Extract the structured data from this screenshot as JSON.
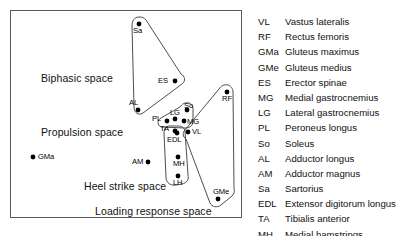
{
  "figure": {
    "title": "",
    "frame": {
      "x": 10,
      "y": 10,
      "w": 232,
      "h": 208
    }
  },
  "chart_data": {
    "type": "scatter",
    "title": "",
    "xlabel": "",
    "ylabel": "",
    "grid": false,
    "legend_position": "right",
    "axis_visible": false,
    "points": [
      {
        "abbr": "Sa",
        "x": 139,
        "y": 24,
        "label_dx": -6,
        "label_dy": 10
      },
      {
        "abbr": "ES",
        "x": 175,
        "y": 81,
        "label_dx": -17,
        "label_dy": 3
      },
      {
        "abbr": "AL",
        "x": 138,
        "y": 110,
        "label_dx": -9,
        "label_dy": -4
      },
      {
        "abbr": "RF",
        "x": 227,
        "y": 92,
        "label_dx": -5,
        "label_dy": 10
      },
      {
        "abbr": "So",
        "x": 187,
        "y": 110,
        "label_dx": -3,
        "label_dy": -1
      },
      {
        "abbr": "LG",
        "x": 175,
        "y": 119,
        "label_dx": -5,
        "label_dy": -3
      },
      {
        "abbr": "MG",
        "x": 184,
        "y": 121,
        "label_dx": 3,
        "label_dy": 4
      },
      {
        "abbr": "PL",
        "x": 167,
        "y": 121,
        "label_dx": -15,
        "label_dy": 1
      },
      {
        "abbr": "TA",
        "x": 175,
        "y": 131,
        "label_dx": -15,
        "label_dy": 1
      },
      {
        "abbr": "EDL",
        "x": 177,
        "y": 133,
        "label_dx": -10,
        "label_dy": 10
      },
      {
        "abbr": "VL",
        "x": 188,
        "y": 132,
        "label_dx": 4,
        "label_dy": 3
      },
      {
        "abbr": "MH",
        "x": 178,
        "y": 157,
        "label_dx": -5,
        "label_dy": 10
      },
      {
        "abbr": "LH",
        "x": 178,
        "y": 176,
        "label_dx": -5,
        "label_dy": 10
      },
      {
        "abbr": "GMa",
        "x": 33,
        "y": 157,
        "label_dx": 5,
        "label_dy": 3
      },
      {
        "abbr": "AM",
        "x": 148,
        "y": 162,
        "label_dx": -16,
        "label_dy": 3
      },
      {
        "abbr": "GMe",
        "x": 218,
        "y": 199,
        "label_dx": -5,
        "label_dy": -4
      }
    ],
    "clusters": [
      {
        "name": "Biphasic space",
        "label_x": 41,
        "label_y": 72,
        "members": [
          "Sa",
          "ES",
          "AL"
        ],
        "outline": "M 139,17 C 134,17 132,21 132,26 L 134,107 C 134,113 139,116 143,113 L 182,84 C 186,81 185,76 181,74 L 146,20 C 144,17.5 142,17 139,17 Z"
      },
      {
        "name": "Propulsion space",
        "label_x": 41,
        "label_y": 126,
        "members": [
          "So",
          "LG",
          "MG",
          "PL"
        ],
        "outline": "M 189,103 C 185,102 182,104 180,107 L 161,118 C 157,120 157,125 161,127 L 185,128 C 191,128 194,124 193,119 L 193,108 C 192,105 191,103.5 189,103 Z"
      },
      {
        "name": "Heel strike space",
        "label_x": 84,
        "label_y": 180,
        "members": [
          "TA",
          "EDL",
          "MH",
          "LH"
        ],
        "outline": "M 170,126 C 166,126 164,129 164,133 L 166,177 C 166,183 171,186 176,185 L 182,184 C 187,183 189,179 188,175 L 185,131 C 184,127 181,126 178,126 Z"
      },
      {
        "name": "Loading response space",
        "label_x": 95,
        "label_y": 205,
        "members": [
          "RF",
          "VL",
          "GMe"
        ],
        "outline": "M 228,85 C 224,84 221,86 219,89 L 185,130 C 182,133 183,137 186,139 L 210,203 C 212,207 217,208 221,205 L 232,196 C 234,194 235,191 234,189 L 233,91 C 232,87 230,85.5 228,85 Z"
      }
    ]
  },
  "legend": {
    "entries": [
      {
        "abbr": "VL",
        "name": "Vastus lateralis"
      },
      {
        "abbr": "RF",
        "name": "Rectus femoris"
      },
      {
        "abbr": "GMa",
        "name": "Gluteus maximus"
      },
      {
        "abbr": "GMe",
        "name": "Gluteus medius"
      },
      {
        "abbr": "ES",
        "name": "Erector spinae"
      },
      {
        "abbr": "MG",
        "name": "Medial gastrocnemius"
      },
      {
        "abbr": "LG",
        "name": "Lateral gastrocnemius"
      },
      {
        "abbr": "PL",
        "name": "Peroneus longus"
      },
      {
        "abbr": "So",
        "name": "Soleus"
      },
      {
        "abbr": "AL",
        "name": "Adductor longus"
      },
      {
        "abbr": "AM",
        "name": "Adductor magnus"
      },
      {
        "abbr": "Sa",
        "name": "Sartorius"
      },
      {
        "abbr": "EDL",
        "name": "Extensor digitorum longus"
      },
      {
        "abbr": "TA",
        "name": "Tibialis anterior"
      },
      {
        "abbr": "MH",
        "name": "Medial hamstrings"
      },
      {
        "abbr": "LH",
        "name": "Lateral hamstrings"
      }
    ]
  },
  "colors": {
    "frame": "#5a5a5a",
    "outline": "#3a3a3a",
    "point": "#000000",
    "text": "#111111",
    "background": "#ffffff"
  }
}
